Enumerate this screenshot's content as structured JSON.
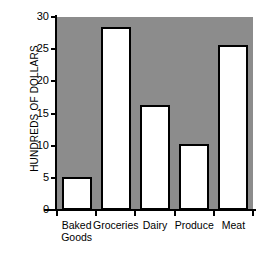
{
  "chart_data": {
    "type": "bar",
    "title": "",
    "xlabel": "",
    "ylabel": "HUNDREDS OF DOLLARS",
    "categories": [
      "Baked\nGoods",
      "Groceries",
      "Dairy",
      "Produce",
      "Meat"
    ],
    "values": [
      5.2,
      28.5,
      16.3,
      10.3,
      25.7
    ],
    "ylim": [
      0,
      30
    ],
    "yticks": [
      0,
      5,
      10,
      15,
      20,
      25,
      30
    ],
    "ytick_labels": [
      "0",
      "5",
      "10",
      "15",
      "20",
      "25",
      "30"
    ],
    "grid": false,
    "legend": null,
    "colors": {
      "plot_background": "#8c8c8c",
      "bar_fill": "#ffffff",
      "bar_outline": "#000000",
      "axis": "#000000",
      "text": "#000000",
      "page_background": "#ffffff"
    }
  }
}
